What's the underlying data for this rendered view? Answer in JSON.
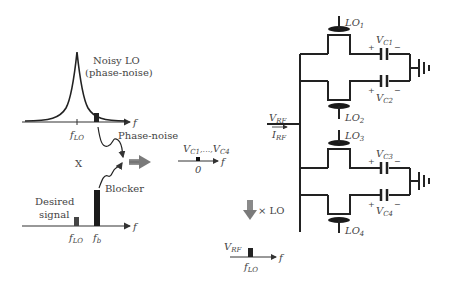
{
  "spectrum_top": {
    "title_line1": "Noisy LO",
    "title_line2": "(phase-noise)",
    "axis_label": "f",
    "tick_label_main": "f",
    "tick_label_sub": "LO",
    "phase_noise_label": "Phase-noise"
  },
  "multiply_symbol": "X",
  "spectrum_bottom": {
    "desired_line1": "Desired",
    "desired_line2": "signal",
    "blocker_label": "Blocker",
    "axis_label": "f",
    "tick1_main": "f",
    "tick1_sub": "LO",
    "tick2_main": "f",
    "tick2_sub": "b"
  },
  "baseband_spectrum": {
    "label_v1": "V",
    "label_v1_sub": "C1",
    "label_sep": ",...,",
    "label_v4": "V",
    "label_v4_sub": "C4",
    "tick_label": "0",
    "axis_label": "f"
  },
  "upconvert": {
    "label": "× LO"
  },
  "rf_spectrum": {
    "label_main": "V",
    "label_sub": "RF",
    "tick_main": "f",
    "tick_sub": "LO",
    "axis_label": "f"
  },
  "circuit": {
    "input_v_main": "V",
    "input_v_sub": "RF",
    "input_i_main": "I",
    "input_i_sub": "RF",
    "switches": [
      {
        "main": "LO",
        "sub": "1"
      },
      {
        "main": "LO",
        "sub": "2"
      },
      {
        "main": "LO",
        "sub": "3"
      },
      {
        "main": "LO",
        "sub": "4"
      }
    ],
    "capacitors": [
      {
        "main": "V",
        "sub": "C1",
        "plus": "+",
        "minus": "−"
      },
      {
        "main": "V",
        "sub": "C2",
        "plus": "+",
        "minus": "−"
      },
      {
        "main": "V",
        "sub": "C3",
        "plus": "+",
        "minus": "−"
      },
      {
        "main": "V",
        "sub": "C4",
        "plus": "+",
        "minus": "−"
      }
    ]
  },
  "colors": {
    "line": "#333333",
    "arrow_gray": "#8a8a8a"
  }
}
